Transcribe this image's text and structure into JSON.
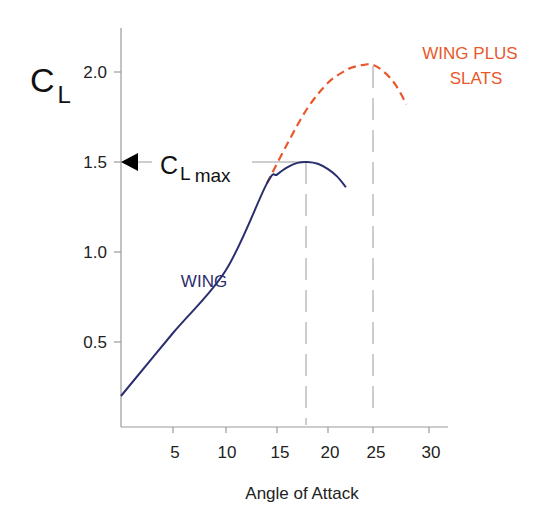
{
  "chart_data": {
    "type": "line",
    "title": "",
    "xlabel": "Angle of Attack",
    "ylabel": "C_L",
    "ylabel_main": "C",
    "ylabel_sub": "L",
    "xlim": [
      0,
      32
    ],
    "ylim": [
      0,
      2.25
    ],
    "x_ticks": [
      5,
      10,
      15,
      20,
      25,
      30
    ],
    "x_tick_labels": [
      "5",
      "10",
      "15",
      "20",
      "25",
      "30"
    ],
    "y_ticks": [
      0.5,
      1.0,
      1.5,
      2.0
    ],
    "y_tick_labels": [
      "0.5",
      "1.0",
      "1.5",
      "2.0"
    ],
    "grid": false,
    "series": [
      {
        "name": "WING",
        "label": "WING",
        "color": "#2b2e6e",
        "style": "solid",
        "x": [
          0,
          5,
          10,
          14,
          15,
          16,
          17,
          18,
          19,
          20,
          21,
          22
        ],
        "y": [
          0.2,
          0.55,
          0.9,
          1.38,
          1.43,
          1.47,
          1.495,
          1.5,
          1.49,
          1.46,
          1.42,
          1.36
        ]
      },
      {
        "name": "WING PLUS SLATS",
        "label_line1": "WING PLUS",
        "label_line2": "SLATS",
        "color": "#e8582c",
        "style": "dashed",
        "x": [
          14,
          16,
          18,
          20,
          22,
          23,
          24,
          25,
          26,
          27,
          28
        ],
        "y": [
          1.38,
          1.6,
          1.8,
          1.94,
          2.01,
          2.03,
          2.04,
          2.04,
          2.0,
          1.93,
          1.82
        ]
      }
    ],
    "annotations": [
      {
        "type": "arrow",
        "text_main": "C",
        "text_sub": "L",
        "text_sub2": "max",
        "y": 1.5,
        "points_to": "y-axis"
      },
      {
        "type": "vline",
        "x": 18,
        "y_from": 0,
        "y_to": 1.5,
        "style": "dashed",
        "series": "WING"
      },
      {
        "type": "vline",
        "x": 25,
        "y_from": 0,
        "y_to": 2.04,
        "style": "dashed",
        "series": "WING PLUS SLATS"
      },
      {
        "type": "hline",
        "y": 1.5,
        "x_from": 0,
        "x_to": 18
      }
    ]
  }
}
